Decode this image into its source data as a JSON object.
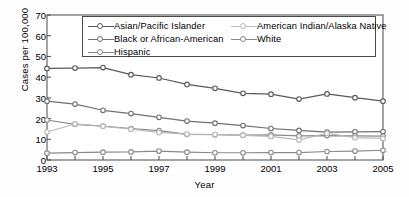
{
  "chart_data": {
    "type": "line",
    "title": "",
    "xlabel": "Year",
    "ylabel": "Cases per 100,000",
    "x": [
      1993,
      1994,
      1995,
      1996,
      1997,
      1998,
      1999,
      2000,
      2001,
      2002,
      2003,
      2004,
      2005
    ],
    "xticklabels": [
      "1993",
      "1995",
      "1997",
      "1999",
      "2001",
      "2003",
      "2005"
    ],
    "xtickvalues": [
      1993,
      1995,
      1997,
      1999,
      2001,
      2003,
      2005
    ],
    "yticklabels": [
      "0",
      "10",
      "20",
      "30",
      "40",
      "50",
      "60",
      "70"
    ],
    "ytickvalues": [
      0,
      10,
      20,
      30,
      40,
      50,
      60,
      70
    ],
    "xlim": [
      1993,
      2005
    ],
    "ylim": [
      0,
      70
    ],
    "grid": false,
    "legend_position": "top-inside",
    "series": [
      {
        "name": "Asian/Pacific Islander",
        "color": "#595959",
        "marker": "open-circle",
        "values": [
          44.2,
          44.4,
          44.6,
          41.2,
          39.6,
          36.5,
          34.6,
          32.2,
          31.8,
          29.4,
          31.9,
          30.1,
          28.4
        ]
      },
      {
        "name": "Black or African-American",
        "color": "#707070",
        "marker": "open-circle",
        "values": [
          28.4,
          27.0,
          24.0,
          22.4,
          20.6,
          18.8,
          17.8,
          16.6,
          15.2,
          14.3,
          13.5,
          13.6,
          13.7
        ]
      },
      {
        "name": "Hispanic",
        "color": "#8a8a8a",
        "marker": "open-circle",
        "values": [
          19.3,
          17.2,
          16.4,
          15.2,
          14.2,
          12.4,
          12.2,
          12.0,
          12.1,
          11.6,
          11.8,
          11.6,
          11.5
        ]
      },
      {
        "name": "American Indian/Alaska Native",
        "color": "#b8b8b8",
        "marker": "open-circle",
        "values": [
          13.5,
          17.4,
          16.3,
          14.9,
          13.3,
          12.5,
          12.3,
          11.9,
          11.4,
          9.7,
          12.9,
          10.8,
          10.4
        ]
      },
      {
        "name": "White",
        "color": "#8a8a8a",
        "marker": "open-circle",
        "values": [
          3.3,
          3.6,
          3.8,
          3.9,
          4.3,
          3.8,
          3.5,
          3.5,
          3.6,
          3.6,
          4.1,
          4.3,
          4.7
        ]
      }
    ]
  },
  "legend": {
    "col1": [
      "Asian/Pacific Islander",
      "Black or African-American",
      "Hispanic"
    ],
    "col2": [
      "American Indian/Alaska Native",
      "White"
    ]
  }
}
